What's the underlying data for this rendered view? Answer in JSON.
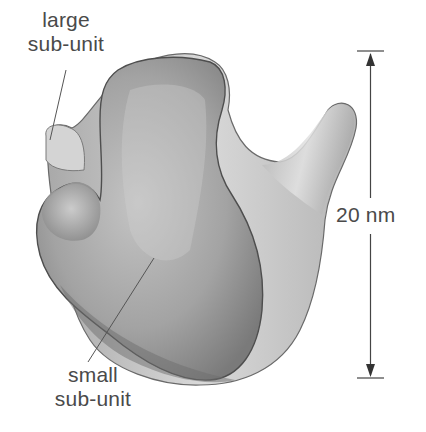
{
  "figure": {
    "labels": {
      "large_subunit": {
        "line1": "large",
        "line2": "sub-unit"
      },
      "small_subunit": {
        "line1": "small",
        "line2": "sub-unit"
      }
    },
    "scale_bar": {
      "label": "20 nm",
      "value": 20,
      "unit": "nm"
    },
    "colors": {
      "background": "#ffffff",
      "large_subunit_fill": "#c8c8c8",
      "small_subunit_fill": "#9a9a9a",
      "outline": "#5a5a5a",
      "text": "#4a4a4a",
      "scale_bar": "#444444"
    }
  }
}
